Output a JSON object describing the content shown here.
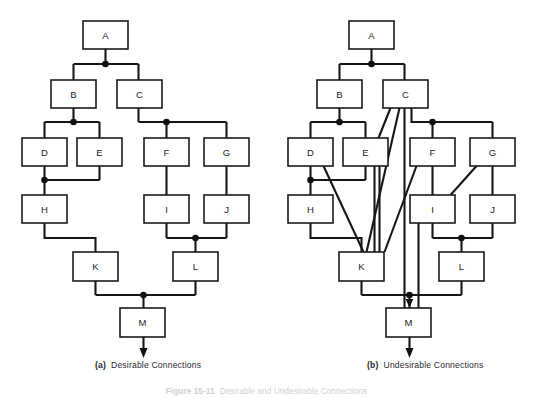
{
  "figure": {
    "number_label": "Figure 15-11",
    "caption_text": "Desirable and Undesirable Connections",
    "panels": [
      {
        "id": "a",
        "tag": "(a)",
        "title": "Desirable Connections",
        "nodes": [
          {
            "id": "A",
            "label": "A",
            "x": 83,
            "y": 21,
            "w": 45,
            "h": 28
          },
          {
            "id": "B",
            "label": "B",
            "x": 51,
            "y": 80,
            "w": 45,
            "h": 28
          },
          {
            "id": "C",
            "label": "C",
            "x": 117,
            "y": 80,
            "w": 45,
            "h": 28
          },
          {
            "id": "D",
            "label": "D",
            "x": 22,
            "y": 138,
            "w": 45,
            "h": 28
          },
          {
            "id": "E",
            "label": "E",
            "x": 77,
            "y": 138,
            "w": 45,
            "h": 28
          },
          {
            "id": "F",
            "label": "F",
            "x": 144,
            "y": 138,
            "w": 45,
            "h": 28
          },
          {
            "id": "G",
            "label": "G",
            "x": 204,
            "y": 138,
            "w": 45,
            "h": 28
          },
          {
            "id": "H",
            "label": "H",
            "x": 22,
            "y": 195,
            "w": 45,
            "h": 28
          },
          {
            "id": "I",
            "label": "I",
            "x": 144,
            "y": 195,
            "w": 45,
            "h": 28
          },
          {
            "id": "J",
            "label": "J",
            "x": 204,
            "y": 195,
            "w": 45,
            "h": 28
          },
          {
            "id": "K",
            "label": "K",
            "x": 73,
            "y": 252,
            "w": 45,
            "h": 29
          },
          {
            "id": "L",
            "label": "L",
            "x": 173,
            "y": 252,
            "w": 45,
            "h": 29
          },
          {
            "id": "M",
            "label": "M",
            "x": 120,
            "y": 308,
            "w": 45,
            "h": 29
          }
        ],
        "edges": [
          {
            "from": "A",
            "to": "B",
            "kind": "orthogonal"
          },
          {
            "from": "A",
            "to": "C",
            "kind": "orthogonal"
          },
          {
            "from": "B",
            "to": "D",
            "kind": "orthogonal"
          },
          {
            "from": "B",
            "to": "E",
            "kind": "orthogonal"
          },
          {
            "from": "C",
            "to": "F",
            "kind": "orthogonal"
          },
          {
            "from": "C",
            "to": "G",
            "kind": "orthogonal"
          },
          {
            "from": "D",
            "to": "H",
            "kind": "orthogonal"
          },
          {
            "from": "E",
            "to": "H",
            "kind": "orthogonal"
          },
          {
            "from": "F",
            "to": "I",
            "kind": "orthogonal"
          },
          {
            "from": "G",
            "to": "J",
            "kind": "orthogonal"
          },
          {
            "from": "H",
            "to": "K",
            "kind": "orthogonal"
          },
          {
            "from": "I",
            "to": "L",
            "kind": "orthogonal"
          },
          {
            "from": "J",
            "to": "L",
            "kind": "orthogonal"
          },
          {
            "from": "K",
            "to": "M",
            "kind": "orthogonal"
          },
          {
            "from": "L",
            "to": "M",
            "kind": "orthogonal"
          }
        ],
        "junction_dots": [
          {
            "x": 105,
            "y": 64
          },
          {
            "x": 73,
            "y": 122
          },
          {
            "x": 166,
            "y": 122
          },
          {
            "x": 45,
            "y": 180
          },
          {
            "x": 166,
            "y": 238
          },
          {
            "x": 143,
            "y": 295
          }
        ],
        "output_arrow": {
          "x": 143,
          "y": 337,
          "to_y": 358
        }
      },
      {
        "id": "b",
        "tag": "(b)",
        "title": "Undesirable Connections",
        "nodes": [
          {
            "id": "A",
            "label": "A",
            "x": 83,
            "y": 21,
            "w": 45,
            "h": 28
          },
          {
            "id": "B",
            "label": "B",
            "x": 51,
            "y": 80,
            "w": 45,
            "h": 28
          },
          {
            "id": "C",
            "label": "C",
            "x": 117,
            "y": 80,
            "w": 45,
            "h": 28
          },
          {
            "id": "D",
            "label": "D",
            "x": 22,
            "y": 138,
            "w": 45,
            "h": 28
          },
          {
            "id": "E",
            "label": "E",
            "x": 77,
            "y": 138,
            "w": 45,
            "h": 28
          },
          {
            "id": "F",
            "label": "F",
            "x": 144,
            "y": 138,
            "w": 45,
            "h": 28
          },
          {
            "id": "G",
            "label": "G",
            "x": 204,
            "y": 138,
            "w": 45,
            "h": 28
          },
          {
            "id": "H",
            "label": "H",
            "x": 22,
            "y": 195,
            "w": 45,
            "h": 28
          },
          {
            "id": "I",
            "label": "I",
            "x": 144,
            "y": 195,
            "w": 45,
            "h": 28
          },
          {
            "id": "J",
            "label": "J",
            "x": 204,
            "y": 195,
            "w": 45,
            "h": 28
          },
          {
            "id": "K",
            "label": "K",
            "x": 73,
            "y": 252,
            "w": 45,
            "h": 29
          },
          {
            "id": "L",
            "label": "L",
            "x": 173,
            "y": 252,
            "w": 45,
            "h": 29
          },
          {
            "id": "M",
            "label": "M",
            "x": 120,
            "y": 308,
            "w": 45,
            "h": 29
          }
        ],
        "edges": [
          {
            "from": "A",
            "to": "B",
            "kind": "orthogonal"
          },
          {
            "from": "A",
            "to": "C",
            "kind": "orthogonal"
          },
          {
            "from": "B",
            "to": "D",
            "kind": "orthogonal"
          },
          {
            "from": "B",
            "to": "E",
            "kind": "orthogonal"
          },
          {
            "from": "C",
            "to": "E",
            "kind": "diagonal"
          },
          {
            "from": "C",
            "to": "K",
            "kind": "diagonal"
          },
          {
            "from": "C",
            "to": "M",
            "kind": "long-vertical"
          },
          {
            "from": "C",
            "to": "F",
            "kind": "orthogonal"
          },
          {
            "from": "C",
            "to": "G",
            "kind": "orthogonal"
          },
          {
            "from": "D",
            "to": "H",
            "kind": "orthogonal"
          },
          {
            "from": "D",
            "to": "K",
            "kind": "diagonal"
          },
          {
            "from": "E",
            "to": "H",
            "kind": "orthogonal"
          },
          {
            "from": "E",
            "to": "K",
            "kind": "diagonal"
          },
          {
            "from": "F",
            "to": "I",
            "kind": "orthogonal"
          },
          {
            "from": "F",
            "to": "K",
            "kind": "diagonal"
          },
          {
            "from": "G",
            "to": "I",
            "kind": "diagonal"
          },
          {
            "from": "G",
            "to": "J",
            "kind": "orthogonal"
          },
          {
            "from": "H",
            "to": "K",
            "kind": "orthogonal"
          },
          {
            "from": "I",
            "to": "M",
            "kind": "long-vertical"
          },
          {
            "from": "I",
            "to": "L",
            "kind": "orthogonal"
          },
          {
            "from": "J",
            "to": "L",
            "kind": "orthogonal"
          },
          {
            "from": "K",
            "to": "M",
            "kind": "orthogonal"
          },
          {
            "from": "L",
            "to": "M",
            "kind": "orthogonal"
          }
        ],
        "junction_dots": [
          {
            "x": 105,
            "y": 64
          },
          {
            "x": 73,
            "y": 122
          },
          {
            "x": 166,
            "y": 122
          },
          {
            "x": 45,
            "y": 180
          },
          {
            "x": 166,
            "y": 238
          },
          {
            "x": 143,
            "y": 295
          }
        ],
        "output_arrow": {
          "x": 143,
          "y": 337,
          "to_y": 358
        }
      }
    ]
  },
  "colors": {
    "ink": "#16161a",
    "box_fill": "#ffffff",
    "page_bg": "#ffffff"
  }
}
